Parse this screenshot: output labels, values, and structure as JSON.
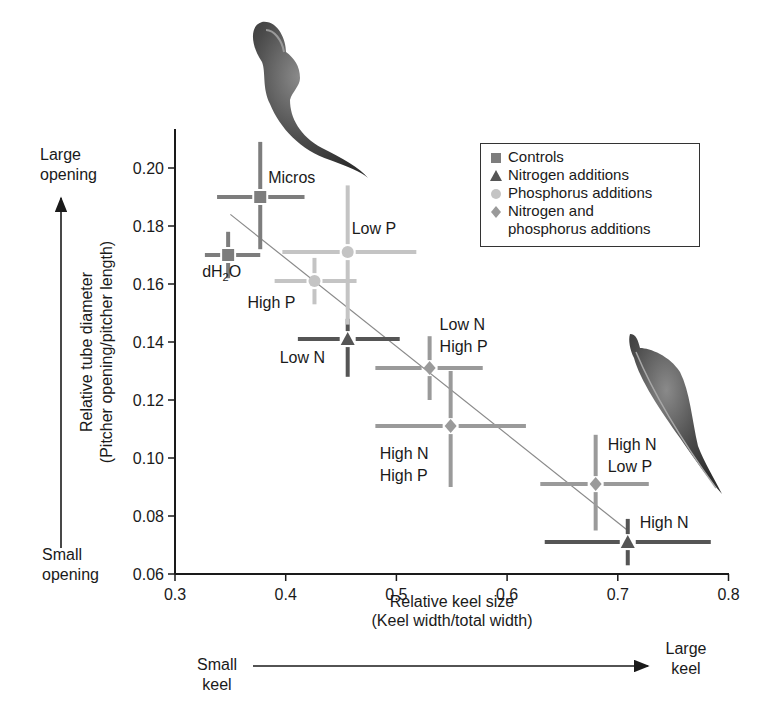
{
  "chart_data": {
    "type": "scatter",
    "title": "",
    "xlabel": "Relative keel size\n(Keel width/total width)",
    "ylabel": "Relative tube diameter\n(Pitcher opening/pitcher length)",
    "xlim": [
      0.3,
      0.8
    ],
    "ylim": [
      0.06,
      0.21
    ],
    "x_ticks": [
      "0.3",
      "0.4",
      "0.5",
      "0.6",
      "0.7",
      "0.8"
    ],
    "y_ticks": [
      "0.06",
      "0.08",
      "0.10",
      "0.12",
      "0.14",
      "0.16",
      "0.18",
      "0.20"
    ],
    "grid": false,
    "legend_position": "upper right",
    "legend": [
      {
        "name": "Controls",
        "marker": "square",
        "color": "#7d7d7d"
      },
      {
        "name": "Nitrogen additions",
        "marker": "triangle",
        "color": "#555555"
      },
      {
        "name": "Phosphorus additions",
        "marker": "circle",
        "color": "#c4c4c4"
      },
      {
        "name": "Nitrogen and\nphosphorus additions",
        "marker": "diamond",
        "color": "#9a9a9a"
      }
    ],
    "series": [
      {
        "name": "Controls",
        "points": [
          {
            "label": "Micros",
            "x": 0.377,
            "y": 0.19,
            "x_err": [
              0.338,
              0.417
            ],
            "y_err": [
              0.172,
              0.209
            ]
          },
          {
            "label": "dH2O",
            "x": 0.348,
            "y": 0.17,
            "x_err": [
              0.327,
              0.377
            ],
            "y_err": [
              0.162,
              0.178
            ]
          }
        ]
      },
      {
        "name": "Nitrogen additions",
        "points": [
          {
            "label": "Low N",
            "x": 0.456,
            "y": 0.141,
            "x_err": [
              0.411,
              0.503
            ],
            "y_err": [
              0.128,
              0.148
            ]
          },
          {
            "label": "High N",
            "x": 0.709,
            "y": 0.071,
            "x_err": [
              0.634,
              0.784
            ],
            "y_err": [
              0.063,
              0.079
            ]
          }
        ]
      },
      {
        "name": "Phosphorus additions",
        "points": [
          {
            "label": "Low P",
            "x": 0.456,
            "y": 0.171,
            "x_err": [
              0.397,
              0.518
            ],
            "y_err": [
              0.146,
              0.194
            ]
          },
          {
            "label": "High P",
            "x": 0.426,
            "y": 0.161,
            "x_err": [
              0.39,
              0.464
            ],
            "y_err": [
              0.153,
              0.169
            ]
          }
        ]
      },
      {
        "name": "Nitrogen and phosphorus additions",
        "points": [
          {
            "label": "Low N\nHigh P",
            "x": 0.53,
            "y": 0.131,
            "x_err": [
              0.481,
              0.578
            ],
            "y_err": [
              0.12,
              0.142
            ]
          },
          {
            "label": "High N\nHigh P",
            "x": 0.549,
            "y": 0.111,
            "x_err": [
              0.481,
              0.617
            ],
            "y_err": [
              0.09,
              0.13
            ]
          },
          {
            "label": "High N\nLow P",
            "x": 0.68,
            "y": 0.091,
            "x_err": [
              0.63,
              0.728
            ],
            "y_err": [
              0.075,
              0.108
            ]
          }
        ]
      }
    ],
    "trendline": {
      "x": [
        0.35,
        0.709
      ],
      "y": [
        0.184,
        0.075
      ]
    },
    "annotations": {
      "y_top": "Large\nopening",
      "y_bottom": "Small\nopening",
      "x_left": "Small\nkeel",
      "x_right": "Large\nkeel"
    }
  },
  "labels": {
    "xlabel_line1": "Relative keel size",
    "xlabel_line2": "(Keel width/total width)",
    "ylabel_line1": "Relative tube diameter",
    "ylabel_line2": "(Pitcher opening/pitcher length)",
    "large_opening_1": "Large",
    "large_opening_2": "opening",
    "small_opening_1": "Small",
    "small_opening_2": "opening",
    "small_keel_1": "Small",
    "small_keel_2": "keel",
    "large_keel_1": "Large",
    "large_keel_2": "keel"
  }
}
